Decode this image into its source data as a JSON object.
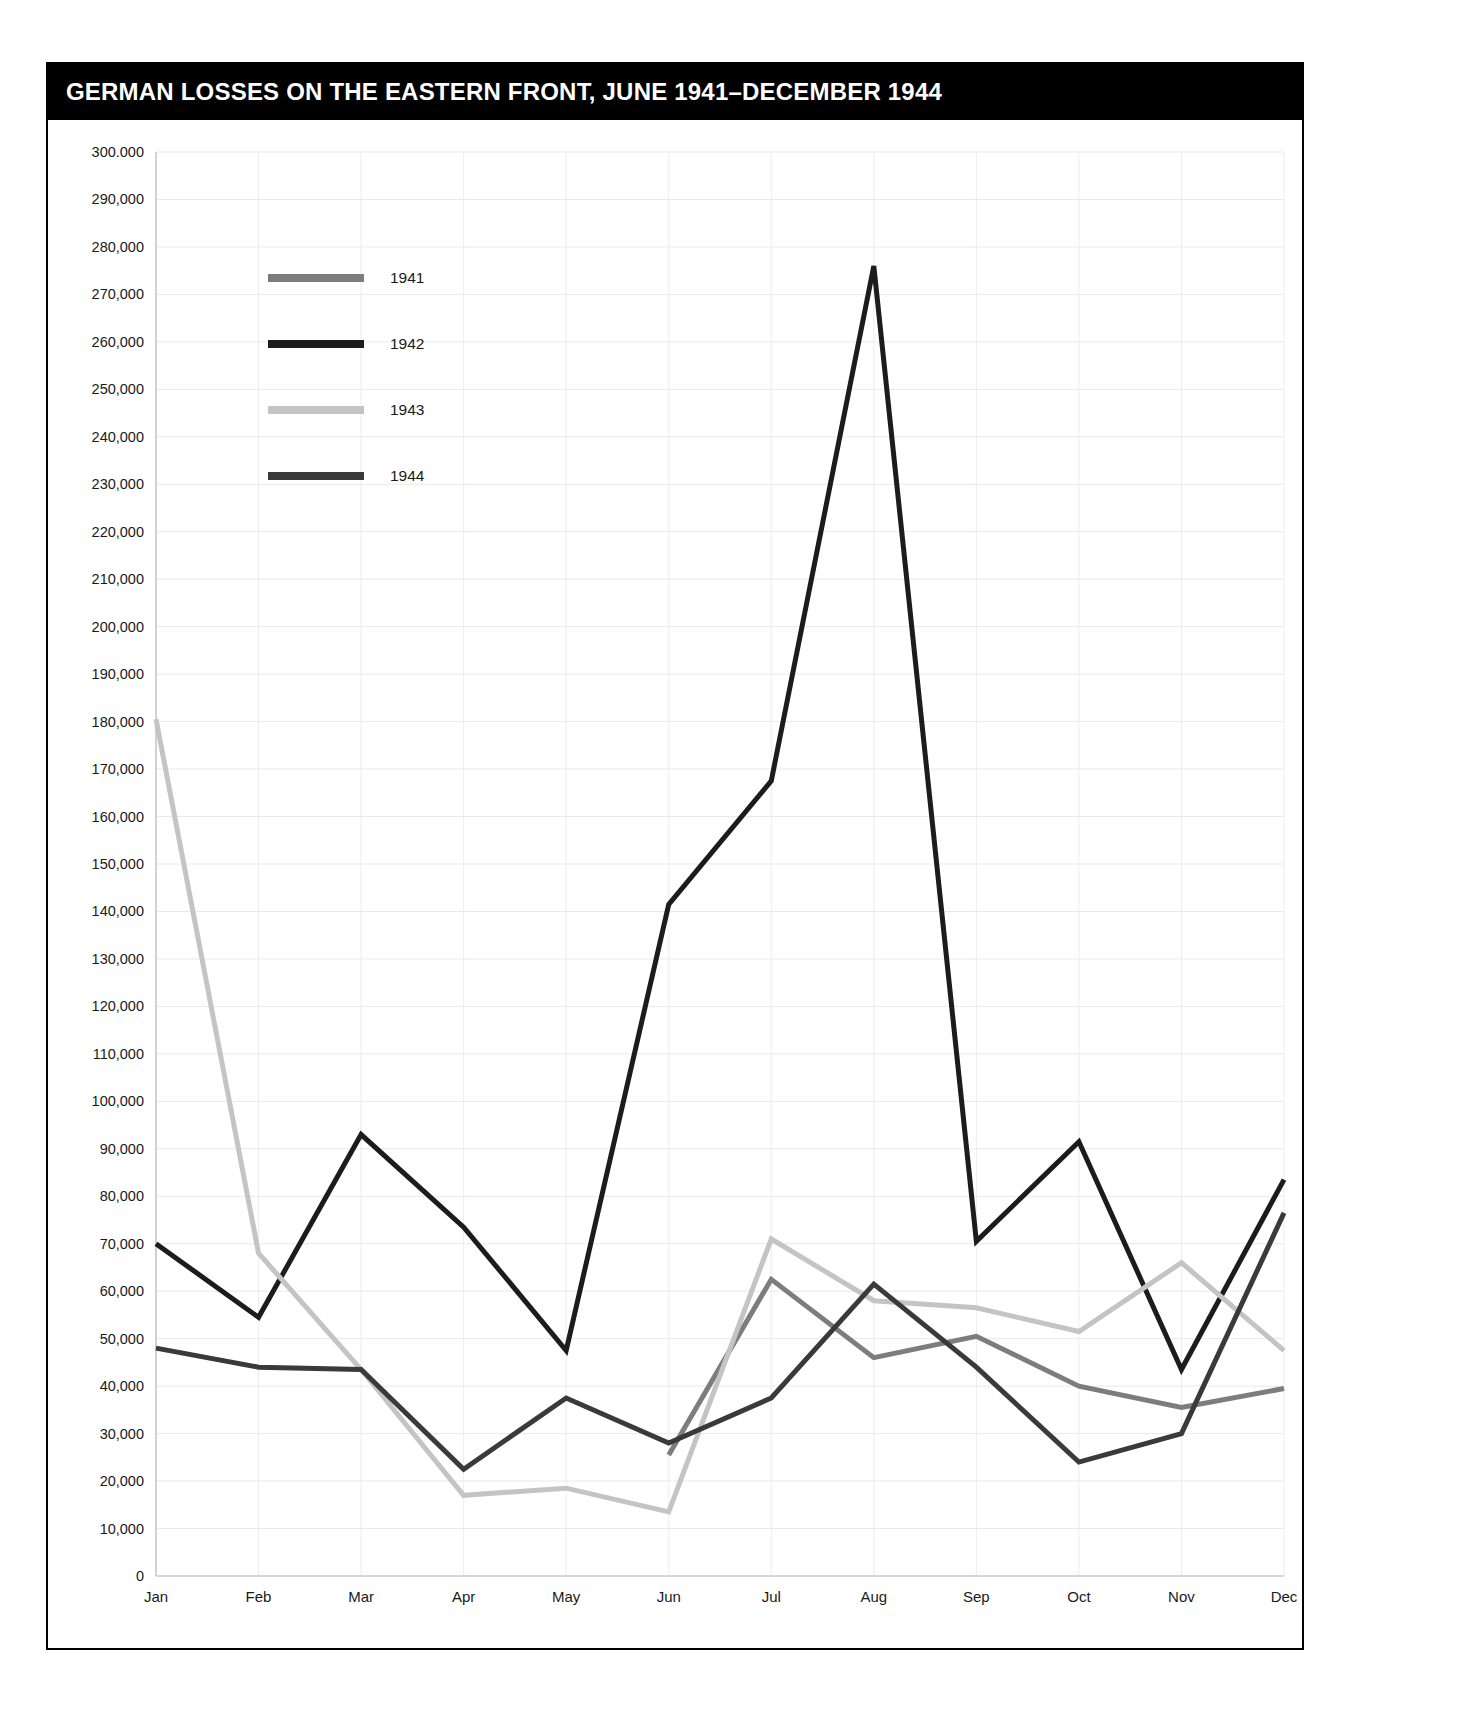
{
  "figure": {
    "title": "GERMAN LOSSES ON THE EASTERN FRONT, JUNE 1941–DECEMBER 1944",
    "background_color": "#ffffff",
    "banner_color": "#000000",
    "banner_text_color": "#ffffff",
    "frame_color": "#000000"
  },
  "chart_data": {
    "type": "line",
    "title": "GERMAN LOSSES ON THE EASTERN FRONT, JUNE 1941–DECEMBER 1944",
    "subtitle": "",
    "xlabel": "",
    "ylabel": "",
    "categories": [
      "Jan",
      "Feb",
      "Mar",
      "Apr",
      "May",
      "Jun",
      "Jul",
      "Aug",
      "Sep",
      "Oct",
      "Nov",
      "Dec"
    ],
    "xtick_labels": [
      "Jan",
      "Feb",
      "Mar",
      "Apr",
      "May",
      "Jun",
      "Jul",
      "Aug",
      "Sep",
      "Oct",
      "Nov",
      "Dec"
    ],
    "ylim": [
      0,
      300000
    ],
    "ytick_values": [
      0,
      10000,
      20000,
      30000,
      40000,
      50000,
      60000,
      70000,
      80000,
      90000,
      100000,
      110000,
      120000,
      130000,
      140000,
      150000,
      160000,
      170000,
      180000,
      190000,
      200000,
      210000,
      220000,
      230000,
      240000,
      250000,
      260000,
      270000,
      280000,
      290000,
      300000
    ],
    "ytick_labels": [
      "0",
      "10,000",
      "20,000",
      "30,000",
      "40,000",
      "50,000",
      "60,000",
      "70,000",
      "80,000",
      "90,000",
      "100,000",
      "110,000",
      "120,000",
      "130,000",
      "140,000",
      "150,000",
      "160,000",
      "170,000",
      "180,000",
      "190,000",
      "200,000",
      "210,000",
      "220,000",
      "230,000",
      "240,000",
      "250,000",
      "260,000",
      "270,000",
      "280,000",
      "290,000",
      "300.000"
    ],
    "grid": true,
    "grid_axis": "both",
    "legend_position": "upper-left-inside",
    "series": [
      {
        "name": "1941",
        "color": "#7d7d7d",
        "line_width": 5,
        "values": [
          null,
          null,
          null,
          null,
          null,
          25500,
          62500,
          46000,
          50500,
          40000,
          35500,
          39500
        ]
      },
      {
        "name": "1942",
        "color": "#1c1c1c",
        "line_width": 5,
        "values": [
          70000,
          54500,
          93000,
          73500,
          47500,
          141500,
          167500,
          276000,
          70500,
          91500,
          43500,
          83500
        ]
      },
      {
        "name": "1943",
        "color": "#c4c4c4",
        "line_width": 5,
        "values": [
          180500,
          68000,
          43500,
          17000,
          18500,
          13500,
          71000,
          58000,
          56500,
          51500,
          66000,
          47500
        ]
      },
      {
        "name": "1944",
        "color": "#3a3a3a",
        "line_width": 5,
        "values": [
          48000,
          44000,
          43500,
          22500,
          37500,
          28000,
          37500,
          61500,
          44000,
          24000,
          30000,
          76500
        ]
      }
    ],
    "legend_entries": [
      {
        "label": "1941",
        "color": "#7d7d7d"
      },
      {
        "label": "1942",
        "color": "#1c1c1c"
      },
      {
        "label": "1943",
        "color": "#c4c4c4"
      },
      {
        "label": "1944",
        "color": "#3a3a3a"
      }
    ]
  }
}
